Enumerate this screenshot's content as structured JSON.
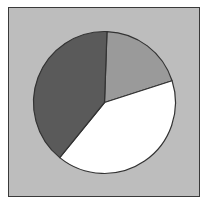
{
  "chart_data": {
    "type": "pie",
    "title": "",
    "legend": [],
    "start_angle_deg": 2,
    "direction": "clockwise",
    "slices": [
      {
        "label": "",
        "value": 19.5,
        "color": "#9a9a9a"
      },
      {
        "label": "",
        "value": 40.8,
        "color": "#ffffff"
      },
      {
        "label": "",
        "value": 39.7,
        "color": "#5a5a5a"
      }
    ],
    "values": [
      19.5,
      40.8,
      39.7
    ],
    "background_color": "#bdbdbd",
    "stroke_color": "#333333"
  }
}
